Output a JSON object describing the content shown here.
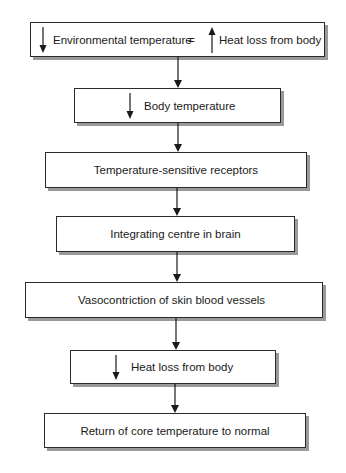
{
  "diagram": {
    "type": "flowchart",
    "direction": "top-to-bottom",
    "colors": {
      "line": "#2a2a2a",
      "shadow": "#9a9a9a",
      "background": "#ffffff"
    },
    "nodes": [
      {
        "id": "n1",
        "left_icon": "down-arrow-icon",
        "text": "Environmental temperature",
        "operator": "=",
        "right_icon": "up-arrow-icon",
        "text2": "Heat loss from body"
      },
      {
        "id": "n2",
        "left_icon": "down-arrow-icon",
        "text": "Body temperature"
      },
      {
        "id": "n3",
        "text": "Temperature-sensitive receptors"
      },
      {
        "id": "n4",
        "text": "Integrating centre in brain"
      },
      {
        "id": "n5",
        "text": "Vasocontriction of skin blood vessels"
      },
      {
        "id": "n6",
        "left_icon": "down-arrow-icon",
        "text": "Heat loss from body"
      },
      {
        "id": "n7",
        "text": "Return of core temperature to normal"
      }
    ],
    "edges": [
      {
        "from": "n1",
        "to": "n2"
      },
      {
        "from": "n2",
        "to": "n3"
      },
      {
        "from": "n3",
        "to": "n4"
      },
      {
        "from": "n4",
        "to": "n5"
      },
      {
        "from": "n5",
        "to": "n6"
      },
      {
        "from": "n6",
        "to": "n7"
      }
    ]
  }
}
